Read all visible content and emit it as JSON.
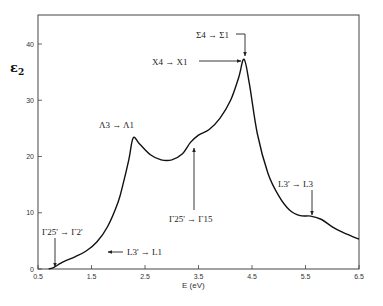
{
  "chart_data": {
    "type": "line",
    "title": "",
    "xlabel": "E (eV)",
    "ylabel": "ε2",
    "xlim": [
      0.5,
      6.5
    ],
    "ylim": [
      0,
      45
    ],
    "grid": false,
    "legend": null,
    "x_ticks": [
      "0.5",
      "1.5",
      "2.5",
      "3.5",
      "4.5",
      "5.5",
      "6.5"
    ],
    "y_ticks": [
      "0",
      "10",
      "20",
      "30",
      "40"
    ],
    "series": [
      {
        "name": "ε2",
        "x": [
          0.7,
          0.8,
          0.9,
          1.0,
          1.2,
          1.4,
          1.6,
          1.8,
          2.0,
          2.1,
          2.2,
          2.28,
          2.4,
          2.6,
          2.8,
          3.0,
          3.2,
          3.35,
          3.5,
          3.7,
          3.9,
          4.1,
          4.25,
          4.35,
          4.45,
          4.6,
          4.8,
          5.0,
          5.2,
          5.4,
          5.6,
          5.8,
          6.0,
          6.2,
          6.5
        ],
        "y": [
          0,
          0.3,
          0.9,
          1.4,
          2.2,
          3.2,
          4.8,
          7.5,
          12,
          15.5,
          19.5,
          23.3,
          22.2,
          20.3,
          19.4,
          19.4,
          20.5,
          22.5,
          23.8,
          24.8,
          26.8,
          30.0,
          34,
          37.3,
          33,
          24,
          17,
          13,
          10.5,
          9.5,
          9.4,
          8.8,
          7.5,
          6.5,
          5.3
        ]
      }
    ],
    "annotations": [
      {
        "text": "Γ25' → Γ2'",
        "x": 0.8,
        "y": 0,
        "arrow": "down"
      },
      {
        "text": "← L3' → L1",
        "x": 1.7,
        "y": 3.5,
        "arrow": "left"
      },
      {
        "text": "Λ3 → Λ1",
        "x": 2.28,
        "y": 23.3,
        "arrow": "none"
      },
      {
        "text": "Γ25' → Γ15",
        "x": 3.35,
        "y": 22.5,
        "arrow": "up"
      },
      {
        "text": "X4 → X1",
        "x": 4.35,
        "y": 37.3,
        "arrow": "right"
      },
      {
        "text": "Σ4 → Σ1",
        "x": 4.35,
        "y": 37.3,
        "arrow": "down"
      },
      {
        "text": "L3' → L3",
        "x": 5.6,
        "y": 9.4,
        "arrow": "down"
      }
    ]
  },
  "labels": {
    "ylabel": "ε",
    "ylabel_sub": "2",
    "xlabel": "E (eV)",
    "x0_label": "0.5",
    "ann_gamma2": "Γ25' → Γ2'",
    "ann_L1": "L3' → L1",
    "ann_lambda": "Λ3 → Λ1",
    "ann_gamma15": "Γ25' → Γ15",
    "ann_X": "X4 → X1",
    "ann_sigma": "Σ4 → Σ1",
    "ann_L3": "L3' → L3"
  }
}
